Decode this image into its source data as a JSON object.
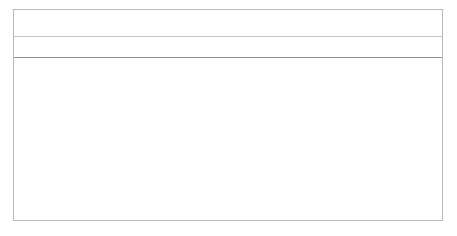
{
  "chart_data": {
    "type": "bar",
    "orientation": "horizontal",
    "xlabel": "",
    "ylabel": "",
    "xlim": [
      0,
      50
    ],
    "grid": true,
    "legend": false,
    "bar_color": "#111111",
    "tick_labels": [
      "0%",
      "10%",
      "20%",
      "30%",
      "40%",
      "50%"
    ],
    "ticks": [
      0,
      10,
      20,
      30,
      40,
      50
    ],
    "categories": [
      "PAS 1192-2:2013",
      "BS 1192:2007 +A2:2016",
      "The new unified plan of work stages (for example the RIBA Plan of Work 2013)",
      "Uniclass 2015",
      "PAS 1192-3:2014"
    ],
    "values": [
      44,
      43,
      36,
      34,
      33
    ],
    "value_labels": [
      "44%",
      "43%",
      "36%",
      "34%",
      "33%"
    ]
  }
}
